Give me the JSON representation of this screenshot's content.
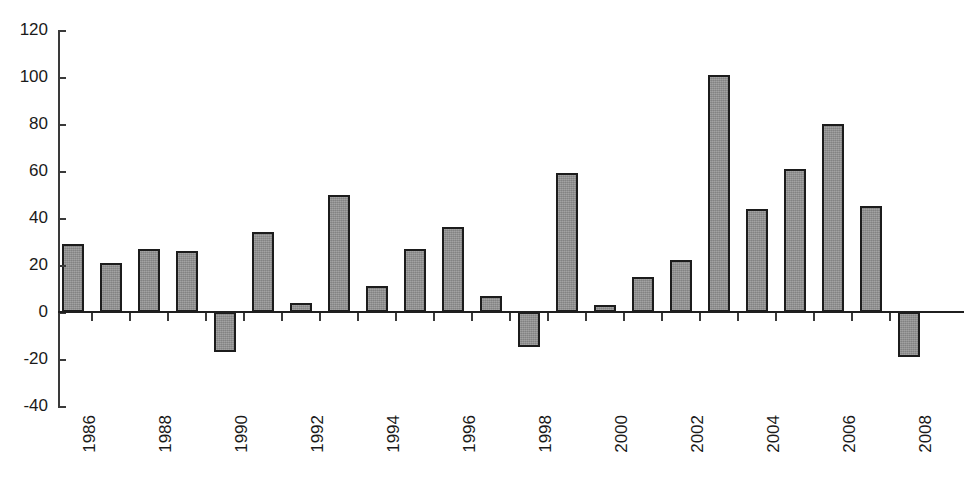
{
  "chart_data": {
    "type": "bar",
    "title": "",
    "subtitle": "",
    "xlabel": "",
    "ylabel": "",
    "grid": false,
    "legend": "none",
    "ylim": [
      -40,
      120
    ],
    "ytick_labels": [
      "120",
      "100",
      "80",
      "60",
      "40",
      "20",
      "0",
      "-20",
      "-40"
    ],
    "ytick_values": [
      120,
      100,
      80,
      60,
      40,
      20,
      0,
      -20,
      -40
    ],
    "xtick_labels": [
      "1986",
      "1988",
      "1990",
      "1992",
      "1994",
      "1996",
      "1998",
      "2000",
      "2002",
      "2004",
      "2006",
      "2008"
    ],
    "categories": [
      "1986",
      "1987",
      "1988",
      "1989",
      "1990",
      "1991",
      "1992",
      "1993",
      "1994",
      "1995",
      "1996",
      "1997",
      "1998",
      "1999",
      "2000",
      "2001",
      "2002",
      "2003",
      "2004",
      "2005",
      "2006",
      "2007",
      "2008"
    ],
    "values": [
      29,
      21,
      27,
      26,
      -17,
      34,
      4,
      50,
      11,
      27,
      36,
      7,
      -15,
      59,
      3,
      15,
      22,
      101,
      44,
      61,
      80,
      45,
      -19
    ],
    "colors": {
      "bar_fill": "#8f8f8f",
      "bar_border": "#1c1c1c",
      "axis": "#3a3a3a",
      "baseline": "#1f1f1f",
      "text": "#1a1a1a",
      "background": "#ffffff"
    }
  }
}
